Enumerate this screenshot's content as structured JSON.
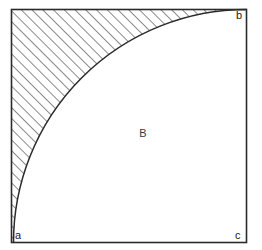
{
  "figure": {
    "background_color": "#ffffff",
    "stroke_color": "#2b2b2b",
    "hatch_color": "#2b2b2b",
    "frame": {
      "x": 11.5,
      "y": 9.5,
      "width": 235,
      "height": 233,
      "stroke_width": 1.6
    },
    "arc": {
      "description": "quarter circle from a to b centered at c",
      "center_x": 246.5,
      "center_y": 242.5,
      "radius": 233,
      "start_x": 13.5,
      "start_y": 242.5,
      "end_x": 246.5,
      "end_y": 9.5,
      "stroke_width": 1.5
    },
    "hatch": {
      "pattern": "diagonal-lines",
      "angle_deg": 45,
      "spacing": 7.6,
      "line_width": 1.1
    },
    "vertices": [
      {
        "id": "a",
        "label": "a",
        "x": 15,
        "y": 239,
        "anchor": "start"
      },
      {
        "id": "b",
        "label": "b",
        "x": 236,
        "y": 19,
        "anchor": "start"
      },
      {
        "id": "c",
        "label": "c",
        "x": 235,
        "y": 239,
        "anchor": "start"
      }
    ],
    "regions": [
      {
        "id": "B",
        "label": "B",
        "x": 143,
        "y": 137,
        "filled": false
      },
      {
        "id": "hatched",
        "label": "",
        "filled": true
      }
    ]
  }
}
